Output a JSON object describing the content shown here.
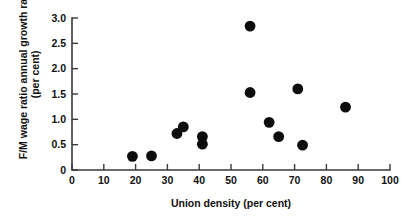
{
  "chart_data": {
    "type": "scatter",
    "title": "",
    "xlabel": "Union density (per cent)",
    "ylabel_line1": "F/M wage ratio annual growth rate",
    "ylabel_line2": "(per cent)",
    "xlim": [
      0,
      100
    ],
    "ylim": [
      0,
      3.0
    ],
    "xticks": [
      0,
      10,
      20,
      30,
      40,
      50,
      60,
      70,
      80,
      90,
      100
    ],
    "xticklabels": [
      "0",
      "10",
      "20",
      "30",
      "40",
      "50",
      "60",
      "70",
      "80",
      "90",
      "100"
    ],
    "yticks": [
      0,
      0.5,
      1.0,
      1.5,
      2.0,
      2.5,
      3.0
    ],
    "yticklabels": [
      "0",
      "0.5",
      "1.0",
      "1.5",
      "2.0",
      "2.5",
      "3.0"
    ],
    "grid": false,
    "legend": null,
    "marker": "filled-circle",
    "marker_color": "#0d0d0d",
    "marker_size": 5.4,
    "points": [
      {
        "x": 19.0,
        "y": 0.27
      },
      {
        "x": 25.0,
        "y": 0.28
      },
      {
        "x": 33.0,
        "y": 0.72
      },
      {
        "x": 35.0,
        "y": 0.85
      },
      {
        "x": 41.0,
        "y": 0.66
      },
      {
        "x": 41.0,
        "y": 0.51
      },
      {
        "x": 56.0,
        "y": 2.84
      },
      {
        "x": 56.0,
        "y": 1.53
      },
      {
        "x": 62.0,
        "y": 0.94
      },
      {
        "x": 65.0,
        "y": 0.66
      },
      {
        "x": 71.0,
        "y": 1.6
      },
      {
        "x": 72.5,
        "y": 0.49
      },
      {
        "x": 86.0,
        "y": 1.24
      }
    ]
  },
  "figure": {
    "background_color": "#ffffff",
    "axis_color": "#3a3a3a"
  }
}
